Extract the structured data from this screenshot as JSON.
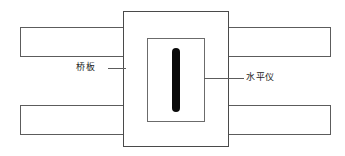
{
  "diagram": {
    "type": "mechanical-schematic",
    "background_color": "#ffffff",
    "line_color": "#5c5c5c",
    "vial_color": "#0a0a0a",
    "labels": {
      "bridge_plate": "桥板",
      "level_instrument": "水平仪"
    },
    "parts": [
      {
        "name": "beam-top-left",
        "label": ""
      },
      {
        "name": "beam-top-right",
        "label": ""
      },
      {
        "name": "beam-bottom-left",
        "label": ""
      },
      {
        "name": "beam-bottom-right",
        "label": ""
      },
      {
        "name": "housing",
        "label": ""
      },
      {
        "name": "window-frame",
        "label": ""
      },
      {
        "name": "bubble-vial",
        "label": ""
      }
    ]
  }
}
